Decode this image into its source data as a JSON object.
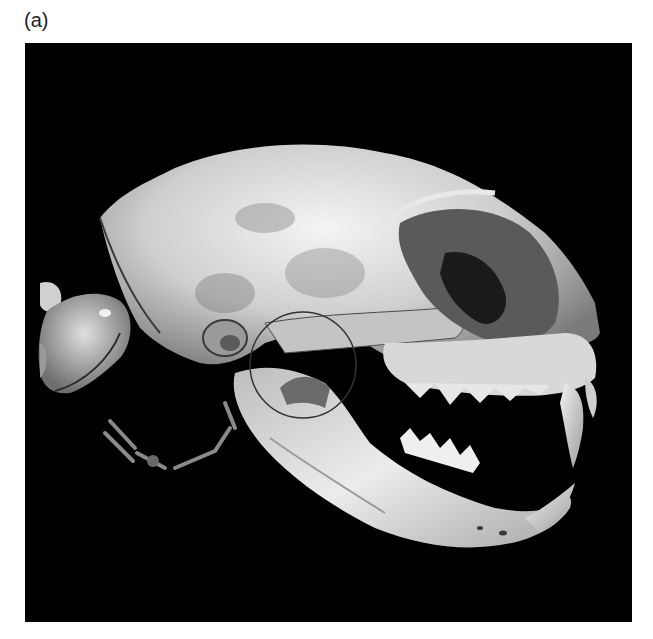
{
  "figure": {
    "panel_label": "(a)",
    "image_description": "3D CT volume rendering of a cat skull, lateral view, jaw open, with a circle highlighting the temporomandibular joint region",
    "annotation": {
      "type": "circle",
      "target": "temporomandibular joint",
      "color": "#333333"
    },
    "background_color": "#000000"
  }
}
